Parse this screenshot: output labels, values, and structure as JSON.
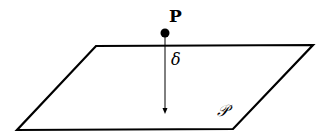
{
  "diagram": {
    "point_label": "P",
    "distance_label": "δ",
    "plane_label": "𝒫",
    "plane_vertices": [
      [
        96,
        46
      ],
      [
        313,
        45
      ],
      [
        233,
        129
      ],
      [
        17,
        130
      ]
    ],
    "point": [
      165,
      33
    ],
    "arrow_end": [
      165,
      113
    ],
    "stroke_color": "#000000"
  }
}
